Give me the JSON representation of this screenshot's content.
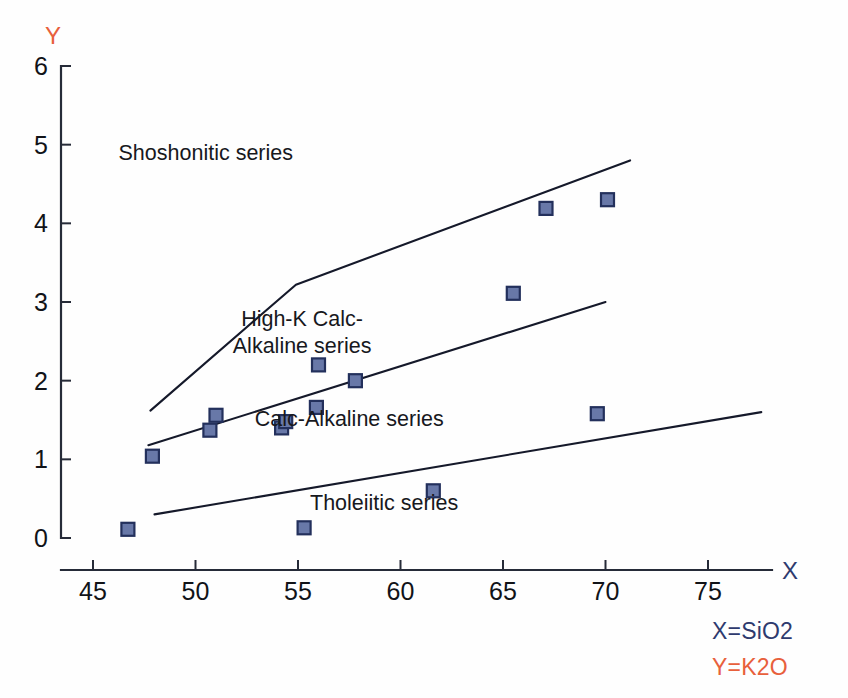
{
  "chart_data": {
    "type": "scatter",
    "title": "",
    "xlabel": "X",
    "ylabel": "Y",
    "xlabel_meaning": "X=SiO2",
    "ylabel_meaning": "Y=K2O",
    "xlim": [
      44.2,
      78.0
    ],
    "ylim": [
      0,
      6
    ],
    "grid": false,
    "legend": "none",
    "xticks": [
      45,
      50,
      55,
      60,
      65,
      70,
      75
    ],
    "yticks": [
      0,
      1,
      2,
      3,
      4,
      5,
      6
    ],
    "xtick_labels": [
      "45",
      "50",
      "55",
      "60",
      "65",
      "70",
      "75"
    ],
    "ytick_labels": [
      "0",
      "1",
      "2",
      "3",
      "4",
      "5",
      "6"
    ],
    "series": [
      {
        "name": "samples",
        "marker": "square",
        "color": "#6878a8",
        "edge_color": "#23305c",
        "points": [
          {
            "x": 46.7,
            "y": 0.11
          },
          {
            "x": 47.9,
            "y": 1.04
          },
          {
            "x": 50.7,
            "y": 1.37
          },
          {
            "x": 51.0,
            "y": 1.56
          },
          {
            "x": 54.2,
            "y": 1.4
          },
          {
            "x": 54.4,
            "y": 1.48
          },
          {
            "x": 55.3,
            "y": 0.13
          },
          {
            "x": 55.9,
            "y": 1.66
          },
          {
            "x": 56.0,
            "y": 2.2
          },
          {
            "x": 57.8,
            "y": 2.0
          },
          {
            "x": 61.6,
            "y": 0.6
          },
          {
            "x": 65.5,
            "y": 3.11
          },
          {
            "x": 67.1,
            "y": 4.19
          },
          {
            "x": 69.6,
            "y": 1.58
          },
          {
            "x": 70.1,
            "y": 4.3
          }
        ]
      }
    ],
    "boundaries": [
      {
        "name": "shoshonitic-lower-boundary",
        "label": "Shoshonitic / High-K Calc-Alkaline divide",
        "vertices": [
          [
            47.8,
            1.62
          ],
          [
            54.9,
            3.22
          ],
          [
            71.2,
            4.8
          ]
        ]
      },
      {
        "name": "high-k-lower-boundary",
        "label": "High-K Calc-Alkaline / Calc-Alkaline divide",
        "vertices": [
          [
            47.7,
            1.18
          ],
          [
            70.0,
            3.0
          ]
        ]
      },
      {
        "name": "calc-alkaline-lower-boundary",
        "label": "Calc-Alkaline / Tholeiitic divide",
        "vertices": [
          [
            48.0,
            0.3
          ],
          [
            77.6,
            1.6
          ]
        ]
      }
    ],
    "annotations": [
      {
        "name": "shoshonitic-series-label",
        "text": "Shoshonitic series",
        "x": 50.5,
        "y": 4.8
      },
      {
        "name": "high-k-calc-alkaline-series-label",
        "line1": "High-K Calc-",
        "line2": "Alkaline series",
        "x": 55.2,
        "y": 2.7
      },
      {
        "name": "calc-alkaline-series-label",
        "text": "Calc-Alkaline series",
        "x": 57.5,
        "y": 1.42
      },
      {
        "name": "tholeiitic-series-label",
        "text": "Tholeiitic series",
        "x": 59.2,
        "y": 0.35
      }
    ]
  },
  "axes": {
    "x_axis_name": "X",
    "y_axis_name": "Y",
    "x_axis_name_color": "#2e3a6e",
    "y_axis_name_color": "#e8603c"
  },
  "legend": {
    "x_definition": "X=SiO2",
    "y_definition": "Y=K2O",
    "x_color": "#2e3a6e",
    "y_color": "#e8603c"
  }
}
